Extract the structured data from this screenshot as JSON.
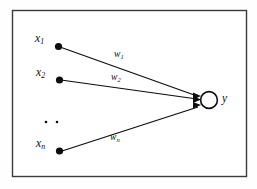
{
  "figure": {
    "border_color": "#3a3a3a",
    "ink_color": "#0d0d0d",
    "background_color": "#fefefe"
  },
  "inputs": [
    {
      "id": "x1",
      "label": "x",
      "sub": "1"
    },
    {
      "id": "x2",
      "label": "x",
      "sub": "2"
    },
    {
      "id": "xn",
      "label": "x",
      "sub": "n"
    }
  ],
  "weights": [
    {
      "id": "w1",
      "label": "w",
      "sub": "1"
    },
    {
      "id": "w2",
      "label": "w",
      "sub": "2"
    },
    {
      "id": "wn",
      "label": "w",
      "sub": "n"
    }
  ],
  "output": {
    "id": "y",
    "label": "y"
  },
  "ellipsis": {
    "symbol": "..",
    "dots": 2
  }
}
